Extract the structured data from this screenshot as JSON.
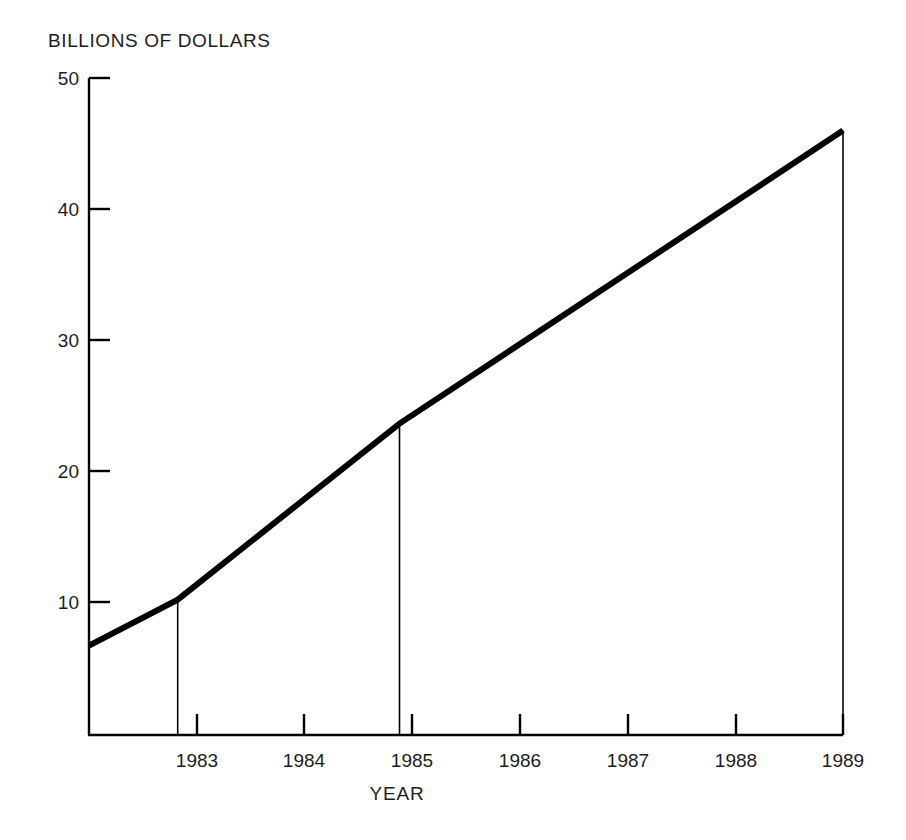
{
  "chart_data": {
    "type": "line",
    "title": "BILLIONS OF DOLLARS",
    "xlabel": "YEAR",
    "ylabel": "BILLIONS OF DOLLARS",
    "x": [
      1982.2,
      1983,
      1985,
      1989
    ],
    "values": [
      6.8,
      10.3,
      23.7,
      46.0
    ],
    "series": [
      {
        "name": "Billions of dollars",
        "values": [
          6.8,
          10.3,
          23.7,
          46.0
        ]
      }
    ],
    "xlim": [
      1982.2,
      1989
    ],
    "ylim": [
      0,
      50
    ],
    "xticks": [
      1983,
      1984,
      1985,
      1986,
      1987,
      1988,
      1989
    ],
    "xtick_labels": [
      "1983",
      "1984",
      "1985",
      "1986",
      "1987",
      "1988",
      "1989"
    ],
    "yticks": [
      10,
      20,
      30,
      40,
      50
    ],
    "ytick_labels": [
      "10",
      "20",
      "30",
      "40",
      "50"
    ],
    "grid": false,
    "legend": "none",
    "line_color": "#000000",
    "line_width_px": 6,
    "dropline_years": [
      1983,
      1985,
      1989
    ],
    "dropline_color": "#000000",
    "axis_color": "#000000",
    "background_color": "#ffffff"
  },
  "geometry": {
    "plot_left_px": 89,
    "plot_right_px": 843,
    "plot_top_px": 78,
    "plot_bottom_px": 735,
    "px_per_year": 107.5,
    "px_per_unit_y": 13.14
  }
}
